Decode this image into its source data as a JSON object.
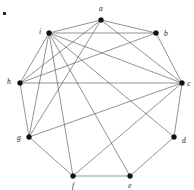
{
  "figure": {
    "caption": "",
    "corner_mark": "·",
    "width": 194,
    "height": 190,
    "colors": {
      "background": "#ffffff",
      "edge": "#4a4a4a",
      "vertex": "#111111",
      "label": "#1a1a1a"
    }
  },
  "chart_data": {
    "type": "diagram",
    "subtype": "node-link-graph",
    "directed": false,
    "layout": "circular-nonagon",
    "node_count": 9,
    "edge_count": 22,
    "nodes": [
      {
        "id": "a",
        "label": "a",
        "x": 101,
        "y": 20,
        "label_x": 101,
        "label_y": 9,
        "degree": 5
      },
      {
        "id": "b",
        "label": "b",
        "x": 156,
        "y": 33,
        "label_x": 166,
        "label_y": 34,
        "degree": 4
      },
      {
        "id": "c",
        "label": "c",
        "x": 182,
        "y": 83,
        "label_x": 189,
        "label_y": 84,
        "degree": 8
      },
      {
        "id": "d",
        "label": "d",
        "x": 174,
        "y": 137,
        "label_x": 184,
        "label_y": 141,
        "degree": 4
      },
      {
        "id": "e",
        "label": "e",
        "x": 130,
        "y": 176,
        "label_x": 130,
        "label_y": 186,
        "degree": 3
      },
      {
        "id": "f",
        "label": "f",
        "x": 73,
        "y": 176,
        "label_x": 73,
        "label_y": 186,
        "degree": 3
      },
      {
        "id": "g",
        "label": "g",
        "x": 29,
        "y": 137,
        "label_x": 19,
        "label_y": 138,
        "degree": 6
      },
      {
        "id": "h",
        "label": "h",
        "x": 20,
        "y": 83,
        "label_x": 9,
        "label_y": 82,
        "degree": 6
      },
      {
        "id": "i",
        "label": "i",
        "x": 49,
        "y": 33,
        "label_x": 40,
        "label_y": 32,
        "degree": 9
      }
    ],
    "edges": [
      {
        "source": "a",
        "target": "b",
        "kind": "cycle"
      },
      {
        "source": "b",
        "target": "c",
        "kind": "cycle"
      },
      {
        "source": "c",
        "target": "d",
        "kind": "cycle"
      },
      {
        "source": "d",
        "target": "e",
        "kind": "cycle"
      },
      {
        "source": "e",
        "target": "f",
        "kind": "cycle"
      },
      {
        "source": "f",
        "target": "g",
        "kind": "cycle"
      },
      {
        "source": "g",
        "target": "h",
        "kind": "cycle"
      },
      {
        "source": "h",
        "target": "i",
        "kind": "cycle"
      },
      {
        "source": "i",
        "target": "a",
        "kind": "cycle"
      },
      {
        "source": "a",
        "target": "c",
        "kind": "chord"
      },
      {
        "source": "a",
        "target": "g",
        "kind": "chord"
      },
      {
        "source": "a",
        "target": "h",
        "kind": "chord"
      },
      {
        "source": "b",
        "target": "i",
        "kind": "chord"
      },
      {
        "source": "b",
        "target": "h",
        "kind": "chord"
      },
      {
        "source": "c",
        "target": "i",
        "kind": "chord"
      },
      {
        "source": "c",
        "target": "h",
        "kind": "chord"
      },
      {
        "source": "c",
        "target": "g",
        "kind": "chord"
      },
      {
        "source": "c",
        "target": "f",
        "kind": "chord"
      },
      {
        "source": "d",
        "target": "i",
        "kind": "chord"
      },
      {
        "source": "e",
        "target": "i",
        "kind": "chord"
      },
      {
        "source": "f",
        "target": "i",
        "kind": "chord"
      },
      {
        "source": "g",
        "target": "i",
        "kind": "chord"
      }
    ],
    "xlabel": "",
    "ylabel": "",
    "grid": false,
    "legend": false
  }
}
